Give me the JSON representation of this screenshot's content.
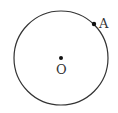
{
  "diagram": {
    "circle": {
      "cx": 61,
      "cy": 58,
      "r": 47,
      "stroke": "#333333"
    },
    "points": [
      {
        "name": "A",
        "label": "A",
        "x": 94,
        "y": 24
      },
      {
        "name": "O",
        "label": "O",
        "x": 61,
        "y": 58
      }
    ]
  }
}
